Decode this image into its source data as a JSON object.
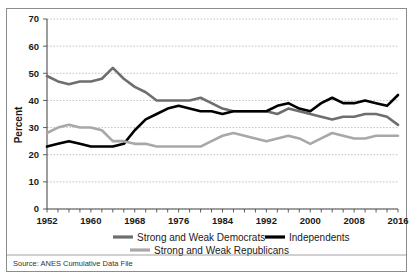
{
  "figure": {
    "source_note": "Source: ANES Cumulative Data File",
    "border_color": "#8c8c8c",
    "background": "#ffffff"
  },
  "legend": {
    "position": "bottom",
    "entries": [
      {
        "label": "Strong and Weak Democrats",
        "color": "#6e6e6e",
        "width": 3.2
      },
      {
        "label": "Independents",
        "color": "#000000",
        "width": 3.2
      },
      {
        "label": "Strong and Weak Republicans",
        "color": "#a8a8a8",
        "width": 3.2
      }
    ]
  },
  "chart_data": {
    "type": "line",
    "title": "",
    "xlabel": "",
    "ylabel": "Percent",
    "ylim": [
      0,
      70
    ],
    "ytick_step": 10,
    "yticks": [
      0,
      10,
      20,
      30,
      40,
      50,
      60,
      70
    ],
    "grid": true,
    "grid_axis": "y",
    "xlim": [
      1952,
      2016
    ],
    "xticks": [
      1952,
      1960,
      1968,
      1976,
      1984,
      1992,
      2000,
      2008,
      2016
    ],
    "xtick_labels": [
      "1952",
      "1960",
      "1968",
      "1976",
      "1984",
      "1992",
      "2000",
      "2008",
      "2016"
    ],
    "x": [
      1952,
      1954,
      1956,
      1958,
      1960,
      1962,
      1964,
      1966,
      1968,
      1970,
      1972,
      1974,
      1976,
      1978,
      1980,
      1982,
      1984,
      1986,
      1988,
      1990,
      1992,
      1994,
      1996,
      1998,
      2000,
      2002,
      2004,
      2006,
      2008,
      2010,
      2012,
      2014,
      2016
    ],
    "series": [
      {
        "name": "Strong and Weak Democrats",
        "color": "#6e6e6e",
        "values": [
          49,
          47,
          46,
          47,
          47,
          48,
          52,
          48,
          45,
          43,
          40,
          40,
          40,
          40,
          41,
          39,
          37,
          36,
          36,
          36,
          36,
          35,
          37,
          36,
          35,
          34,
          33,
          34,
          34,
          35,
          35,
          34,
          31
        ]
      },
      {
        "name": "Independents",
        "color": "#000000",
        "values": [
          23,
          24,
          25,
          24,
          23,
          23,
          23,
          24,
          29,
          33,
          35,
          37,
          38,
          37,
          36,
          36,
          35,
          36,
          36,
          36,
          36,
          38,
          39,
          37,
          36,
          39,
          41,
          39,
          39,
          40,
          39,
          38,
          42
        ]
      },
      {
        "name": "Strong and Weak Republicans",
        "color": "#a8a8a8",
        "values": [
          28,
          30,
          31,
          30,
          30,
          29,
          25,
          25,
          24,
          24,
          23,
          23,
          23,
          23,
          23,
          25,
          27,
          28,
          27,
          26,
          25,
          26,
          27,
          26,
          24,
          26,
          28,
          27,
          26,
          26,
          27,
          27,
          27
        ]
      }
    ]
  }
}
